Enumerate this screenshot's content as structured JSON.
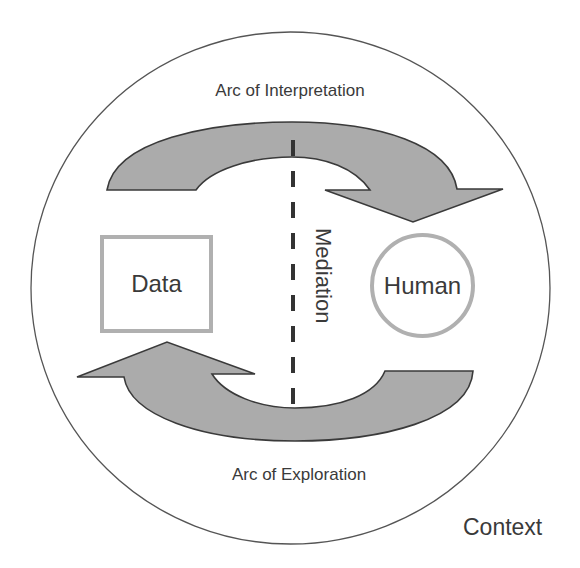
{
  "diagram": {
    "outer_region": {
      "label": "Context",
      "shape": "ellipse",
      "stroke": "#555555"
    },
    "arcs": {
      "top": {
        "label": "Arc of Interpretation",
        "direction": "clockwise: from Data side over the top toward Human",
        "fill": "#ababab",
        "stroke": "#3a3a3a"
      },
      "bottom": {
        "label": "Arc of Exploration",
        "direction": "clockwise: from Human side under the bottom toward Data",
        "fill": "#ababab",
        "stroke": "#3a3a3a"
      }
    },
    "nodes": {
      "data": {
        "label": "Data",
        "shape": "square",
        "border_color": "#b0b0b0"
      },
      "human": {
        "label": "Human",
        "shape": "circle",
        "border_color": "#b0b0b0"
      }
    },
    "divider": {
      "label": "Mediation",
      "style": "dashed",
      "color": "#333333"
    }
  }
}
